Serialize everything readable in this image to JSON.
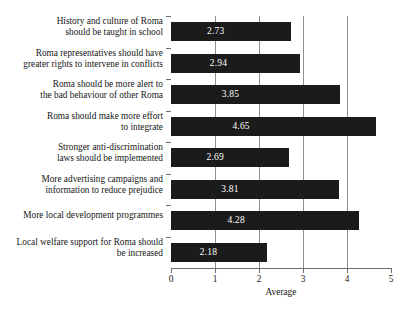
{
  "chart_data": {
    "type": "bar",
    "orientation": "horizontal",
    "title": "",
    "xlabel": "Average",
    "ylabel": "",
    "xlim": [
      0,
      5
    ],
    "xticks": [
      "0",
      "1",
      "2",
      "3",
      "4",
      "5"
    ],
    "grid": "vertical gridlines at 1, 2, 3, 4",
    "legend": "none",
    "bar_color": "#1b1b1b",
    "value_label_color": "#ffffff",
    "categories": [
      "History and culture of Roma should be taught in school",
      "Roma representatives should have greater rights to intervene in conflicts",
      "Roma should be more alert to the bad behaviour of other Roma",
      "Roma should make more effort to integrate",
      "Stronger anti-discrimination laws should be implemented",
      "More advertising campaigns and information to reduce prejudice",
      "More local development programmes",
      "Local welfare support for Roma should be increased"
    ],
    "category_lines": [
      [
        "History and culture of Roma",
        "should be taught in school"
      ],
      [
        "Roma representatives should have",
        "greater rights to intervene in conflicts"
      ],
      [
        "Roma should be more alert to",
        "the bad behaviour of other Roma"
      ],
      [
        "Roma should make more effort",
        "to integrate"
      ],
      [
        "Stronger anti-discrimination",
        "laws should be implemented"
      ],
      [
        "More advertising campaigns and",
        "information to reduce prejudice"
      ],
      [
        "More local development programmes"
      ],
      [
        "Local welfare support for Roma should",
        "be increased"
      ]
    ],
    "values": [
      2.73,
      2.94,
      3.85,
      4.65,
      2.69,
      3.81,
      4.28,
      2.18
    ],
    "value_labels": [
      "2.73",
      "2.94",
      "3.85",
      "4.65",
      "2.69",
      "3.81",
      "4.28",
      "2.18"
    ]
  },
  "caption": {
    "text": ""
  }
}
